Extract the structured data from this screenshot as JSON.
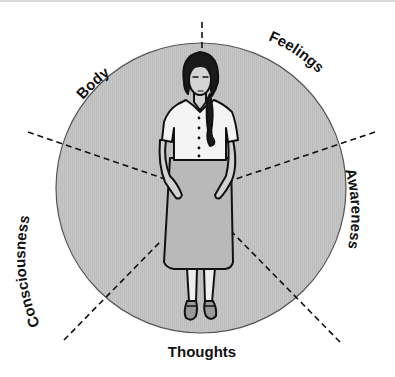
{
  "diagram": {
    "title": "",
    "colors": {
      "circle_fill": "#c4c4c4",
      "circle_stroke": "#555555",
      "ink": "#111111",
      "skirt": "#b8b8b8",
      "shirt": "#f4f4f4",
      "skin": "#d0d0d0",
      "background": "#ffffff"
    },
    "circle": {
      "cx": 201,
      "cy": 188,
      "r": 145
    },
    "segments": [
      {
        "id": "body",
        "label": "Body"
      },
      {
        "id": "feelings",
        "label": "Feelings"
      },
      {
        "id": "awareness",
        "label": "Awareness"
      },
      {
        "id": "thoughts",
        "label": "Thoughts"
      },
      {
        "id": "consciousness",
        "label": "Consciousness"
      }
    ],
    "center_figure": "standing-woman-with-braid-icon"
  }
}
